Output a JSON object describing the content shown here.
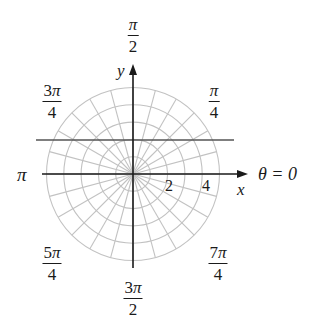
{
  "diagram": {
    "type": "polar-coordinate-grid",
    "center_px": [
      133,
      174
    ],
    "unit_px": 17.3,
    "rings": [
      1,
      2,
      3,
      4,
      5
    ],
    "ray_step_radians": "π/12",
    "ray_count": 24,
    "colors": {
      "grid": "#c2c2c2",
      "axis": "#1a1a1a",
      "line": "#555555",
      "text": "#1a1a1a"
    },
    "axes": {
      "x_label": "x",
      "y_label": "y",
      "polar_axis_label": "θ = 0",
      "tick_labels": [
        "2",
        "4"
      ]
    },
    "horizontal_line": {
      "equation": "y = 2",
      "description": "horizontal line through y = 2"
    },
    "angle_labels": {
      "pi_over_2": {
        "numerator": "π",
        "coef": "",
        "denominator": "2"
      },
      "pi_over_4": {
        "numerator": "π",
        "coef": "",
        "denominator": "4"
      },
      "three_pi_over_4": {
        "numerator": "π",
        "coef": "3",
        "denominator": "4"
      },
      "pi": {
        "text": "π"
      },
      "five_pi_over_4": {
        "numerator": "π",
        "coef": "5",
        "denominator": "4"
      },
      "three_pi_over_2": {
        "numerator": "π",
        "coef": "3",
        "denominator": "2"
      },
      "seven_pi_over_4": {
        "numerator": "π",
        "coef": "7",
        "denominator": "4"
      }
    }
  }
}
